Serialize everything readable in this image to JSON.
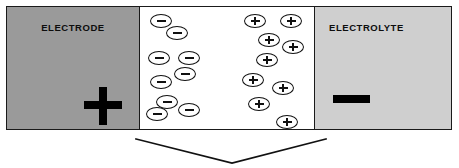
{
  "diagram": {
    "electrode_panel": {
      "label": "ELECTRODE",
      "polarity_symbol": "+",
      "polarity_name": "plus-sign",
      "fill_color": "#9a9a9a"
    },
    "electrolyte_gap": {
      "fill_color": "#ffffff",
      "negative_ions": {
        "symbol": "−",
        "count": 8,
        "positions": [
          {
            "x": 10,
            "y": 7
          },
          {
            "x": 26,
            "y": 19
          },
          {
            "x": 8,
            "y": 44
          },
          {
            "x": 38,
            "y": 44
          },
          {
            "x": 10,
            "y": 68
          },
          {
            "x": 34,
            "y": 60
          },
          {
            "x": 16,
            "y": 88
          },
          {
            "x": 38,
            "y": 96
          },
          {
            "x": 6,
            "y": 100
          }
        ]
      },
      "positive_ions": {
        "symbol": "+",
        "count": 9,
        "positions": [
          {
            "x": 104,
            "y": 7
          },
          {
            "x": 140,
            "y": 7
          },
          {
            "x": 118,
            "y": 26
          },
          {
            "x": 142,
            "y": 33
          },
          {
            "x": 116,
            "y": 46
          },
          {
            "x": 102,
            "y": 66
          },
          {
            "x": 132,
            "y": 74
          },
          {
            "x": 108,
            "y": 90
          },
          {
            "x": 136,
            "y": 108
          }
        ]
      }
    },
    "electrolyte_panel": {
      "label": "ELECTROLYTE",
      "polarity_symbol": "−",
      "polarity_name": "minus-sign",
      "fill_color": "#cfcfcf"
    },
    "flow_arrow": {
      "name": "chevron-down-arrow",
      "shape": "v-chevron",
      "direction": "down",
      "stroke_color": "#111111"
    },
    "stroke_color": "#1a1a1a",
    "background_color": "#ffffff"
  }
}
